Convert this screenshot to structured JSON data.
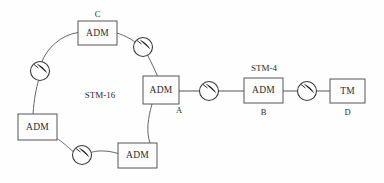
{
  "diagram": {
    "background_color": "#fefefe",
    "line_color": "#555555",
    "text_color": "#2b2b2b"
  },
  "ring": {
    "label": "STM-16",
    "label_x": 100,
    "label_y": 95,
    "nodes": [
      {
        "id": "ring-adm-top",
        "type": "ADM",
        "text": "ADM",
        "x": 78,
        "y": 21,
        "w": 39,
        "h": 24,
        "label": "C",
        "label_pos": "above"
      },
      {
        "id": "ring-adm-left",
        "type": "ADM",
        "text": "ADM",
        "x": 18,
        "y": 114,
        "w": 39,
        "h": 26,
        "label": "",
        "label_pos": "none"
      },
      {
        "id": "ring-adm-bottom",
        "type": "ADM",
        "text": "ADM",
        "x": 118,
        "y": 143,
        "w": 39,
        "h": 25,
        "label": "",
        "label_pos": "none"
      },
      {
        "id": "ring-adm-hub",
        "type": "ADM",
        "text": "ADM",
        "x": 143,
        "y": 76,
        "w": 36,
        "h": 28,
        "label": "A",
        "label_pos": "below-right"
      }
    ],
    "regenerators": [
      {
        "id": "regen-ring-ne",
        "cx": 143,
        "cy": 47,
        "r": 9.5
      },
      {
        "id": "regen-ring-nw",
        "cx": 40,
        "cy": 71,
        "r": 9.5
      },
      {
        "id": "regen-ring-sw",
        "cx": 82,
        "cy": 155,
        "r": 9.5
      }
    ]
  },
  "chain": {
    "label": "STM-4",
    "label_x": 264,
    "label_y": 68,
    "nodes": [
      {
        "id": "chain-adm-b",
        "type": "ADM",
        "text": "ADM",
        "x": 244,
        "y": 78,
        "w": 39,
        "h": 25,
        "label": "B",
        "label_pos": "below"
      },
      {
        "id": "chain-tm-d",
        "type": "TM",
        "text": "TM",
        "x": 330,
        "y": 79,
        "w": 35,
        "h": 24,
        "label": "D",
        "label_pos": "below"
      }
    ],
    "regenerators": [
      {
        "id": "regen-chain-1",
        "cx": 209,
        "cy": 91,
        "r": 9.5
      },
      {
        "id": "regen-chain-2",
        "cx": 307,
        "cy": 91,
        "r": 9.5
      }
    ]
  },
  "links": [
    {
      "id": "link-hub-to-regen1",
      "from": "ring-adm-hub",
      "to": "regen-chain-1"
    },
    {
      "id": "link-regen1-to-b",
      "from": "regen-chain-1",
      "to": "chain-adm-b"
    },
    {
      "id": "link-b-to-regen2",
      "from": "chain-adm-b",
      "to": "regen-chain-2"
    },
    {
      "id": "link-regen2-to-tm",
      "from": "regen-chain-2",
      "to": "chain-tm-d"
    }
  ]
}
